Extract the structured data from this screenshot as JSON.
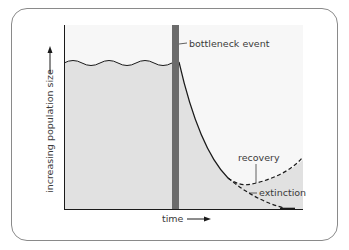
{
  "diagram": {
    "labels": {
      "event": "bottleneck event",
      "recovery": "recovery",
      "extinction": "extinction",
      "x_axis": "time",
      "y_axis": "increasing population size"
    },
    "colors": {
      "frame_border": "#8a8a8a",
      "plot_background": "#f7f7f7",
      "population_fill": "#e1e1e1",
      "bottleneck_bar": "#6b6b6b",
      "curve": "#1a1a1a",
      "axis": "#1a1a1a",
      "text": "#3a3a3a"
    },
    "icons": {
      "x_axis_arrow": "arrow-right-icon",
      "y_axis_arrow": "arrow-up-icon"
    }
  }
}
